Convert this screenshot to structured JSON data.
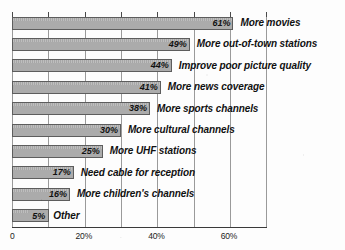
{
  "chart_data": {
    "type": "bar",
    "orientation": "horizontal",
    "title": "",
    "xlabel": "",
    "ylabel": "",
    "xlim": [
      0,
      70
    ],
    "grid": true,
    "legend": null,
    "tick_interval": 10,
    "tick_values": [
      0,
      10,
      20,
      30,
      40,
      50,
      60,
      70
    ],
    "tick_labels": [
      "0",
      "",
      "20%",
      "",
      "40%",
      "",
      "60%",
      ""
    ],
    "categories": [
      "More movies",
      "More out-of-town stations",
      "Improve poor picture quality",
      "More news coverage",
      "More sports channels",
      "More cultural channels",
      "More UHF stations",
      "Need cable for reception",
      "More children's channels",
      "Other"
    ],
    "values": [
      61,
      49,
      44,
      41,
      38,
      30,
      25,
      17,
      16,
      5
    ],
    "data_labels": [
      "61%",
      "49%",
      "44%",
      "41%",
      "38%",
      "30%",
      "25%",
      "17%",
      "16%",
      "5%"
    ],
    "colors": {
      "bar_fill": "#ababab",
      "bar_border": "#5d5d5d",
      "gridline": "#9a9a9a",
      "axis": "#3a3a3a",
      "text": "#111111",
      "background": "#fdfdfd"
    }
  }
}
